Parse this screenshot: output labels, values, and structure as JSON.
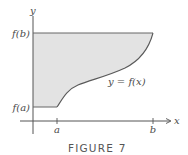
{
  "figure": {
    "caption": "FIGURE 7",
    "axes": {
      "x_label": "x",
      "y_label": "y"
    },
    "ticks": {
      "x": [
        {
          "label": "a"
        },
        {
          "label": "b"
        }
      ],
      "y": [
        {
          "label": "f(a)"
        },
        {
          "label": "f(b)"
        }
      ]
    },
    "curve_label": "y = f(x)",
    "colors": {
      "shade": "#e3e3e3",
      "curve": "#5a5a5a",
      "axis": "#555555",
      "text": "#4a4a4a"
    }
  }
}
